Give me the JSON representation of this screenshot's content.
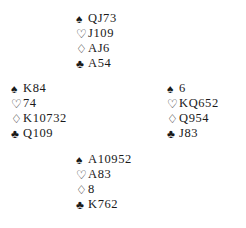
{
  "diagram": {
    "type": "bridge-hand-diagram",
    "background_color": "#ffffff",
    "text_color": "#1a1a1a",
    "suit_symbols": {
      "spades": "♠",
      "hearts": "♡",
      "diamonds": "♢",
      "clubs": "♣"
    }
  },
  "hands": {
    "north": {
      "position_label": "north",
      "spades_symbol": "♠",
      "spades": "QJ73",
      "hearts_symbol": "♡",
      "hearts": "J109",
      "diamonds_symbol": "♢",
      "diamonds": "AJ6",
      "clubs_symbol": "♣",
      "clubs": "A54"
    },
    "west": {
      "position_label": "west",
      "spades_symbol": "♠",
      "spades": "K84",
      "hearts_symbol": "♡",
      "hearts": "74",
      "diamonds_symbol": "♢",
      "diamonds": "K10732",
      "clubs_symbol": "♣",
      "clubs": "Q109"
    },
    "east": {
      "position_label": "east",
      "spades_symbol": "♠",
      "spades": "6",
      "hearts_symbol": "♡",
      "hearts": "KQ652",
      "diamonds_symbol": "♢",
      "diamonds": "Q954",
      "clubs_symbol": "♣",
      "clubs": "J83"
    },
    "south": {
      "position_label": "south",
      "spades_symbol": "♠",
      "spades": "A10952",
      "hearts_symbol": "♡",
      "hearts": "A83",
      "diamonds_symbol": "♢",
      "diamonds": "8",
      "clubs_symbol": "♣",
      "clubs": "K762"
    }
  }
}
